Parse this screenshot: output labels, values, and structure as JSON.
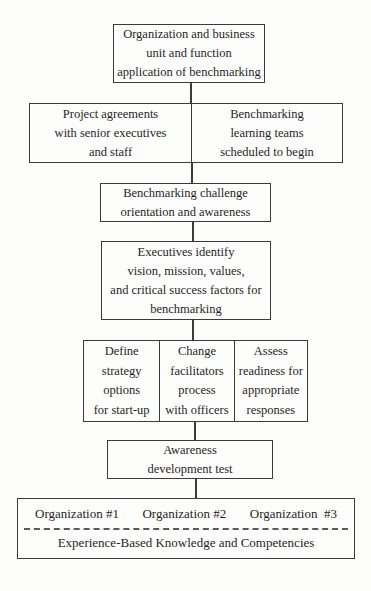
{
  "page": {
    "background": "#fdfdfb",
    "ink_color": "#3b3b3b",
    "text_color": "#1f1f1f"
  },
  "flow": {
    "box1": {
      "lines": [
        "Organization and business",
        "unit and function",
        "application of benchmarking"
      ]
    },
    "box2": {
      "left": {
        "lines": [
          "Project agreements",
          "with senior executives",
          "and staff"
        ]
      },
      "right": {
        "lines": [
          "Benchmarking",
          "learning teams",
          "scheduled to begin"
        ]
      }
    },
    "box3": {
      "lines": [
        "Benchmarking challenge",
        "orientation and awareness"
      ]
    },
    "box4": {
      "lines": [
        "Executives identify",
        "vision, mission, values,",
        "and critical success factors for",
        "benchmarking"
      ]
    },
    "box5": {
      "cells": [
        {
          "lines": [
            "Define",
            "strategy",
            "options",
            "for start-up"
          ]
        },
        {
          "lines": [
            "Change",
            "facilitators",
            "process",
            "with officers"
          ]
        },
        {
          "lines": [
            "Assess",
            "readiness for",
            "appropriate",
            "responses"
          ]
        }
      ]
    },
    "box6": {
      "lines": [
        "Awareness",
        "development test"
      ]
    },
    "box7": {
      "organizations": [
        "Organization #1",
        "Organization #2",
        "Organization  #3"
      ],
      "footer": "Experience-Based Knowledge and Competencies"
    }
  }
}
